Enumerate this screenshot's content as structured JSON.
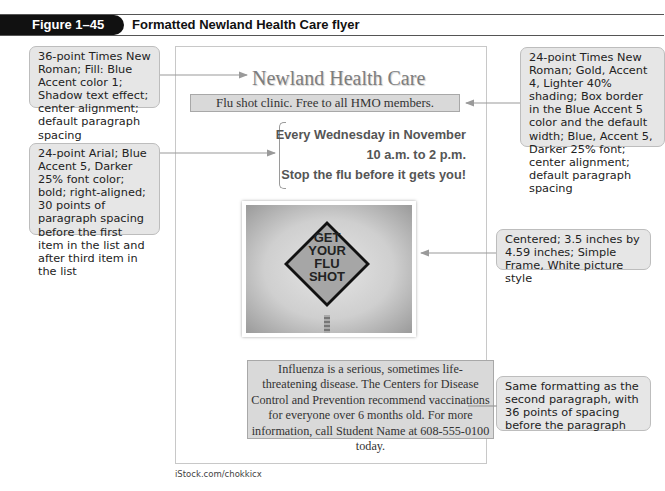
{
  "figure": {
    "label": "Figure 1–45",
    "title": "Formatted Newland Health Care flyer"
  },
  "flyer": {
    "title": "Newland Health Care",
    "subhead": "Flu shot clinic. Free to all HMO members.",
    "list": [
      "Every Wednesday in November",
      "10 a.m. to 2 p.m.",
      "Stop the flu before it gets you!"
    ],
    "image": {
      "alt": "Road sign reading GET YOUR FLU SHOT",
      "sign_lines": [
        "GET",
        "YOUR",
        "FLU",
        "SHOT"
      ]
    },
    "body": "Influenza is a serious, sometimes life-threatening disease. The Centers for Disease Control and Prevention recommend vaccinations for everyone over 6 months old. For more information, call Student Name at 608-555-0100 today."
  },
  "callouts": {
    "title_format": "36-point Times New Roman; Fill: Blue Accent color 1; Shadow text effect; center alignment; default paragraph spacing",
    "list_format": "24-point Arial; Blue Accent 5, Darker 25% font color; bold; right-aligned; 30 points of paragraph spacing before the first item in the list and after third item in the list",
    "subhead_format": "24-point Times New Roman; Gold, Accent 4, Lighter 40% shading; Box border in the Blue Accent 5 color and the default width; Blue, Accent 5, Darker 25% font; center alignment; default paragraph spacing",
    "picture_format": "Centered; 3.5 inches by 4.59 inches; Simple Frame, White picture style",
    "body_format": "Same formatting as the second paragraph, with 36 points of spacing before the paragraph"
  },
  "credit": "iStock.com/chokkicx",
  "colors": {
    "header_bg": "#111111",
    "callout_bg": "#e6e6e6",
    "box_shading": "#d9d9d9",
    "title_gray": "#7e7e7e",
    "list_gray": "#555555"
  }
}
